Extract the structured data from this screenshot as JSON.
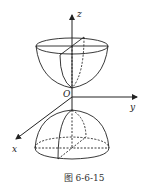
{
  "figure": {
    "caption": "图 6-6-15",
    "axes": {
      "x_label": "x",
      "y_label": "y",
      "z_label": "z",
      "origin_label": "O"
    },
    "shapes": [
      {
        "name": "upper paraboloid bowl",
        "position": "above origin, vertex at O, opening upward"
      },
      {
        "name": "lower paraboloid dome",
        "position": "below origin, apex below O, opening downward"
      }
    ],
    "colors": {
      "stroke": "#222222",
      "background": "#ffffff"
    }
  }
}
